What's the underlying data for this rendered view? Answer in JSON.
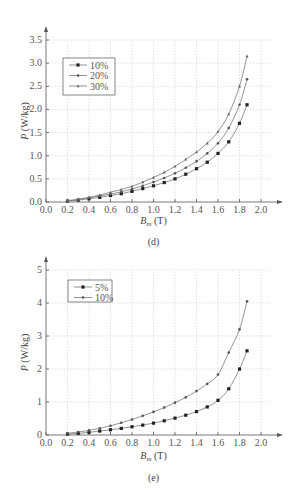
{
  "chart_data": [
    {
      "type": "line",
      "title": "",
      "caption": "(d)",
      "xlabel": "B_m (T)",
      "ylabel": "P (W/kg)",
      "xlim": [
        0.0,
        2.0
      ],
      "ylim": [
        0.0,
        3.5
      ],
      "xticks": [
        "0.0",
        "0.2",
        "0.4",
        "0.6",
        "0.8",
        "1.0",
        "1.2",
        "1.4",
        "1.6",
        "1.8",
        "2.0"
      ],
      "yticks": [
        "0.0",
        "0.5",
        "1.0",
        "1.5",
        "2.0",
        "2.5",
        "3.0",
        "3.5"
      ],
      "grid": true,
      "legend_position": "upper-left",
      "x": [
        0.2,
        0.3,
        0.4,
        0.5,
        0.6,
        0.7,
        0.8,
        0.9,
        1.0,
        1.1,
        1.2,
        1.3,
        1.4,
        1.5,
        1.6,
        1.7,
        1.8,
        1.87
      ],
      "series": [
        {
          "name": "10%",
          "values": [
            0.02,
            0.04,
            0.07,
            0.1,
            0.14,
            0.18,
            0.23,
            0.29,
            0.35,
            0.42,
            0.5,
            0.6,
            0.72,
            0.86,
            1.05,
            1.3,
            1.7,
            2.1
          ]
        },
        {
          "name": "20%",
          "values": [
            0.02,
            0.05,
            0.09,
            0.13,
            0.17,
            0.22,
            0.28,
            0.35,
            0.43,
            0.52,
            0.62,
            0.74,
            0.88,
            1.05,
            1.27,
            1.6,
            2.1,
            2.65
          ]
        },
        {
          "name": "30%",
          "values": [
            0.03,
            0.06,
            0.1,
            0.15,
            0.21,
            0.27,
            0.34,
            0.43,
            0.53,
            0.64,
            0.77,
            0.92,
            1.08,
            1.27,
            1.52,
            1.9,
            2.5,
            3.15
          ]
        }
      ]
    },
    {
      "type": "line",
      "title": "",
      "caption": "(e)",
      "xlabel": "B_m (T)",
      "ylabel": "P (W/kg)",
      "xlim": [
        0.0,
        2.0
      ],
      "ylim": [
        0,
        5
      ],
      "xticks": [
        "0.0",
        "0.2",
        "0.4",
        "0.6",
        "0.8",
        "1.0",
        "1.2",
        "1.4",
        "1.6",
        "1.8",
        "2.0"
      ],
      "yticks": [
        "0",
        "1",
        "2",
        "3",
        "4",
        "5"
      ],
      "grid": true,
      "legend_position": "upper-left",
      "x": [
        0.2,
        0.3,
        0.4,
        0.5,
        0.6,
        0.7,
        0.8,
        0.9,
        1.0,
        1.1,
        1.2,
        1.3,
        1.4,
        1.5,
        1.6,
        1.7,
        1.8,
        1.87
      ],
      "series": [
        {
          "name": "5%",
          "values": [
            0.03,
            0.05,
            0.08,
            0.12,
            0.16,
            0.2,
            0.25,
            0.3,
            0.36,
            0.43,
            0.51,
            0.6,
            0.71,
            0.85,
            1.05,
            1.4,
            2.0,
            2.55
          ]
        },
        {
          "name": "10%",
          "values": [
            0.05,
            0.09,
            0.14,
            0.2,
            0.28,
            0.37,
            0.47,
            0.58,
            0.7,
            0.83,
            0.98,
            1.14,
            1.33,
            1.55,
            1.83,
            2.5,
            3.2,
            4.05
          ]
        }
      ]
    }
  ]
}
